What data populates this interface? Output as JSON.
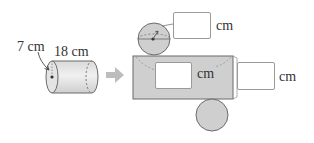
{
  "figure": {
    "cylinder": {
      "radius_label": "7 cm",
      "height_label": "18 cm"
    },
    "arrow": "arrow-right",
    "net": {
      "top_circle_box_unit": "cm",
      "rectangle_width_box_unit": "cm",
      "rectangle_height_box_unit": "cm"
    }
  },
  "colors": {
    "fill_gray": "#cfcfcf",
    "stroke": "#6b6b6b",
    "arrow": "#bdbdbd",
    "text": "#333333"
  }
}
